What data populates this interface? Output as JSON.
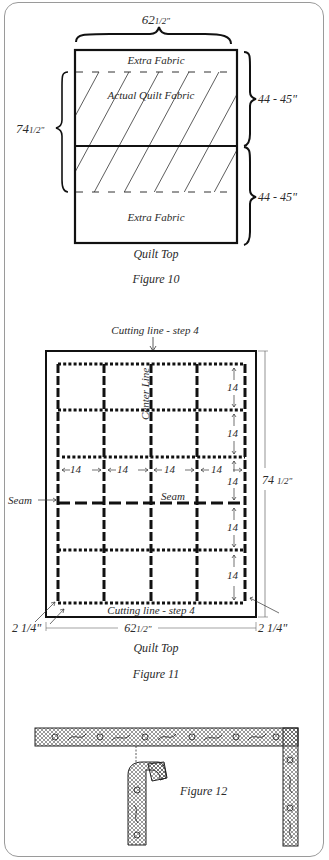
{
  "figure10": {
    "width_label": "62",
    "width_frac": "1/2\"",
    "height_label": "74",
    "height_frac": "1/2\"",
    "top_section_label": "44 - 45\"",
    "bottom_section_label": "44 - 45\"",
    "extra_fabric_top": "Extra Fabric",
    "actual_quilt_fabric": "Actual Quilt Fabric",
    "extra_fabric_bottom": "Extra Fabric",
    "subtitle": "Quilt Top",
    "caption": "Figure 10"
  },
  "figure11": {
    "cutting_line_top": "Cutting line - step 4",
    "cutting_line_bottom": "Cutting line - step 4",
    "center_line": "Center Line",
    "seam_left": "Seam",
    "seam_center": "Seam",
    "block_size": "14",
    "horizontal_dims": [
      "14",
      "14",
      "14",
      "14"
    ],
    "vertical_dims": [
      "14",
      "14",
      "14",
      "14",
      "14"
    ],
    "height_label": "74",
    "height_frac": "1/2\"",
    "width_label": "62",
    "width_frac": "1/2\"",
    "margin_left": "2 1/4\"",
    "margin_right": "2 1/4\"",
    "subtitle": "Quilt Top",
    "caption": "Figure 11"
  },
  "figure12": {
    "caption": "Figure 12"
  }
}
